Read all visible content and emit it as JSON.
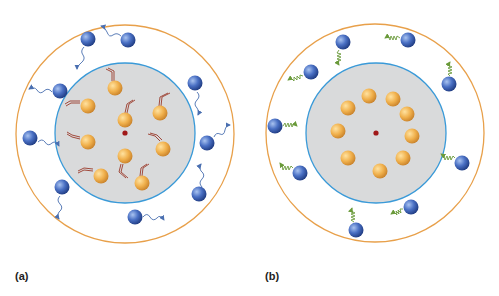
{
  "panels": [
    {
      "label": "(a)",
      "description": "Thermal motion: orange particles inside inner sphere moving randomly (arrows); blue particles in outer shell emitting wavy photons",
      "outer_circle": {
        "cx": 125,
        "cy": 134,
        "r": 109,
        "color": "#e8a04a"
      },
      "inner_circle": {
        "cx": 125,
        "cy": 133,
        "r": 70,
        "color": "#3a9ad8",
        "fill": "#d9dadb"
      },
      "center_dot": {
        "cx": 125,
        "cy": 133,
        "color": "#a01818"
      },
      "orange_particles": [
        [
          115,
          88
        ],
        [
          88,
          106
        ],
        [
          125,
          120
        ],
        [
          160,
          113
        ],
        [
          88,
          142
        ],
        [
          163,
          149
        ],
        [
          125,
          156
        ],
        [
          101,
          176
        ],
        [
          142,
          183
        ]
      ],
      "blue_particles": [
        [
          88,
          39
        ],
        [
          128,
          40
        ],
        [
          60,
          91
        ],
        [
          195,
          83
        ],
        [
          30,
          138
        ],
        [
          207,
          143
        ],
        [
          62,
          187
        ],
        [
          199,
          194
        ],
        [
          135,
          217
        ]
      ],
      "emission_style": "wavy-arrow"
    },
    {
      "label": "(b)",
      "description": "Ordered state: orange particles arranged in a ring; blue particles in outer shell with zigzag (spring) emissions",
      "outer_circle": {
        "cx": 375,
        "cy": 133,
        "r": 109,
        "color": "#e8a04a"
      },
      "inner_circle": {
        "cx": 376,
        "cy": 133,
        "r": 70,
        "color": "#3a9ad8",
        "fill": "#d9dadb"
      },
      "center_dot": {
        "cx": 376,
        "cy": 133,
        "color": "#a01818"
      },
      "orange_particles": [
        [
          369,
          96
        ],
        [
          393,
          99
        ],
        [
          348,
          108
        ],
        [
          407,
          114
        ],
        [
          338,
          131
        ],
        [
          412,
          136
        ],
        [
          348,
          158
        ],
        [
          403,
          158
        ],
        [
          380,
          171
        ]
      ],
      "blue_particles": [
        [
          343,
          42
        ],
        [
          408,
          40
        ],
        [
          311,
          72
        ],
        [
          449,
          84
        ],
        [
          275,
          126
        ],
        [
          462,
          163
        ],
        [
          300,
          173
        ],
        [
          411,
          207
        ],
        [
          356,
          230
        ]
      ],
      "emission_style": "zigzag-arrow"
    }
  ],
  "colors": {
    "orange_particle": "#f0b04c",
    "blue_particle": "#3f63b5",
    "motion_arrow": "#9a3a2a",
    "wave_arrow": "#4a6fb0",
    "zigzag_arrow": "#6a9a3a"
  }
}
